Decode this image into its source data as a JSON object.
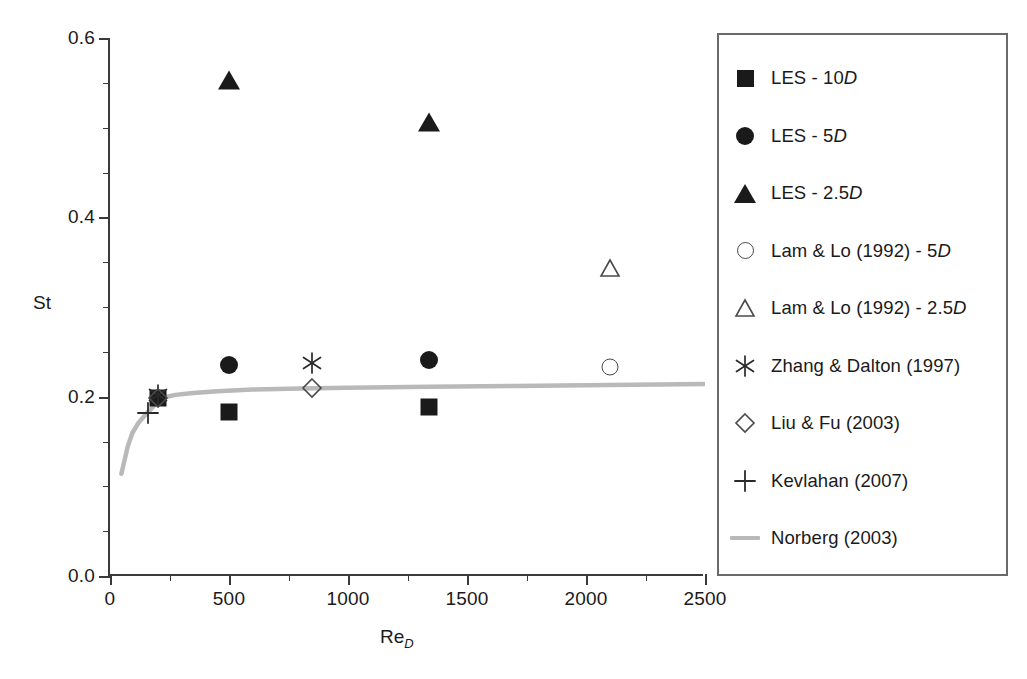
{
  "figure": {
    "background_color": "#ffffff",
    "axis_color": "#3a3a3a",
    "marker_color": "#1a1a1a",
    "open_marker_color": "#4a4a4a",
    "curve_color": "#b9b9b9",
    "legend_border_color": "#6a6a6a"
  },
  "chart_data": {
    "type": "scatter",
    "title": "",
    "xlabel": "Re_D",
    "xlabel_base": "Re",
    "xlabel_sub": "D",
    "ylabel": "St",
    "xlim": [
      0,
      2500
    ],
    "ylim": [
      0.0,
      0.6
    ],
    "xticks": [
      0,
      500,
      1000,
      1500,
      2000,
      2500
    ],
    "xtick_labels": [
      "0",
      "500",
      "1000",
      "1500",
      "2000",
      "2500"
    ],
    "xminor_ticks": [
      250,
      750,
      1250,
      1750,
      2250
    ],
    "yticks": [
      0.0,
      0.2,
      0.4,
      0.6
    ],
    "ytick_labels": [
      "0.0",
      "0.2",
      "0.4",
      "0.6"
    ],
    "yminor_ticks": [
      0.05,
      0.1,
      0.15,
      0.25,
      0.3,
      0.35,
      0.45,
      0.5,
      0.55
    ],
    "grid": false,
    "legend_position": "right-outside",
    "series": [
      {
        "name": "LES - 10D",
        "marker": "square-filled",
        "points": [
          {
            "x": 200,
            "y": 0.198
          },
          {
            "x": 500,
            "y": 0.183
          },
          {
            "x": 1340,
            "y": 0.189
          }
        ]
      },
      {
        "name": "LES - 5D",
        "marker": "circle-filled",
        "points": [
          {
            "x": 500,
            "y": 0.235
          },
          {
            "x": 1340,
            "y": 0.241
          }
        ]
      },
      {
        "name": "LES - 2.5D",
        "marker": "triangle-filled",
        "points": [
          {
            "x": 500,
            "y": 0.553
          },
          {
            "x": 1340,
            "y": 0.506
          }
        ]
      },
      {
        "name": "Lam & Lo (1992) - 5D",
        "marker": "circle-open",
        "points": [
          {
            "x": 2100,
            "y": 0.233
          }
        ]
      },
      {
        "name": "Lam & Lo (1992) - 2.5D",
        "marker": "triangle-open",
        "points": [
          {
            "x": 2100,
            "y": 0.343
          }
        ]
      },
      {
        "name": "Zhang & Dalton (1997)",
        "marker": "asterisk",
        "points": [
          {
            "x": 200,
            "y": 0.202
          },
          {
            "x": 850,
            "y": 0.237
          }
        ]
      },
      {
        "name": "Liu & Fu (2003)",
        "marker": "diamond-open",
        "points": [
          {
            "x": 200,
            "y": 0.198
          },
          {
            "x": 850,
            "y": 0.21
          }
        ]
      },
      {
        "name": "Kevlahan (2007)",
        "marker": "plus",
        "points": [
          {
            "x": 160,
            "y": 0.182
          }
        ]
      },
      {
        "name": "Norberg (2003)",
        "marker": "line",
        "line": true,
        "points": [
          {
            "x": 48,
            "y": 0.114
          },
          {
            "x": 60,
            "y": 0.128
          },
          {
            "x": 75,
            "y": 0.145
          },
          {
            "x": 95,
            "y": 0.16
          },
          {
            "x": 120,
            "y": 0.171
          },
          {
            "x": 150,
            "y": 0.18
          },
          {
            "x": 185,
            "y": 0.19
          },
          {
            "x": 225,
            "y": 0.199
          },
          {
            "x": 275,
            "y": 0.202
          },
          {
            "x": 350,
            "y": 0.204
          },
          {
            "x": 450,
            "y": 0.206
          },
          {
            "x": 600,
            "y": 0.208
          },
          {
            "x": 800,
            "y": 0.209
          },
          {
            "x": 1000,
            "y": 0.21
          },
          {
            "x": 1340,
            "y": 0.211
          },
          {
            "x": 1700,
            "y": 0.212
          },
          {
            "x": 2100,
            "y": 0.213
          },
          {
            "x": 2500,
            "y": 0.214
          }
        ]
      }
    ]
  },
  "legend": {
    "entries": [
      {
        "label_main": "LES - 10",
        "label_italic": "D",
        "marker": "square-filled"
      },
      {
        "label_main": "LES - 5",
        "label_italic": "D",
        "marker": "circle-filled"
      },
      {
        "label_main": "LES - 2.5",
        "label_italic": "D",
        "marker": "triangle-filled"
      },
      {
        "label_main": "Lam & Lo (1992) - 5",
        "label_italic": "D",
        "marker": "circle-open"
      },
      {
        "label_main": "Lam & Lo (1992) - 2.5",
        "label_italic": "D",
        "marker": "triangle-open"
      },
      {
        "label_main": "Zhang & Dalton (1997)",
        "label_italic": "",
        "marker": "asterisk"
      },
      {
        "label_main": "Liu & Fu (2003)",
        "label_italic": "",
        "marker": "diamond-open"
      },
      {
        "label_main": "Kevlahan (2007)",
        "label_italic": "",
        "marker": "plus"
      },
      {
        "label_main": "Norberg (2003)",
        "label_italic": "",
        "marker": "line"
      }
    ]
  }
}
